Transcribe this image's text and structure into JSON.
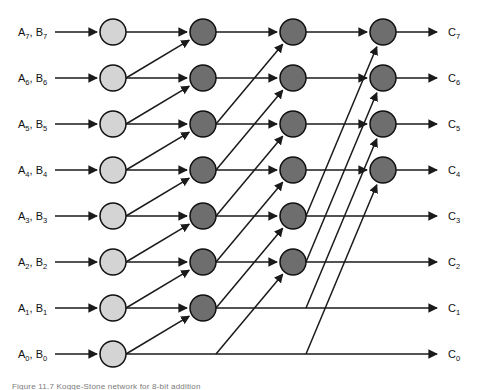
{
  "figure": {
    "caption": "Figure 11.7  Kogge-Stone network for 8-bit addition",
    "width": 483,
    "height": 389,
    "background_color": "#ffffff"
  },
  "colors": {
    "input_node_fill": "#d4d4d4",
    "operator_node_fill": "#6e6e6e",
    "node_stroke": "#111111",
    "edge_stroke": "#1a1a1a",
    "label_text": "#111111",
    "caption_text": "#7a7a7a"
  },
  "geometry": {
    "row_y": [
      32,
      78,
      124,
      170,
      216,
      262,
      308,
      354
    ],
    "column_x": [
      113,
      203,
      293,
      383
    ],
    "node_radius": 13,
    "input_label_x": 18,
    "output_label_x": 448,
    "input_arrow_start_x": 55,
    "output_arrow_end_x": 437
  },
  "rows": [
    {
      "index": 7,
      "y": 32,
      "input_label": "A",
      "input_sub": "7",
      "input_label2": "B",
      "input_sub2": "7",
      "output_label": "C",
      "output_sub": "7",
      "node_columns": [
        0,
        1,
        2,
        3
      ]
    },
    {
      "index": 6,
      "y": 78,
      "input_label": "A",
      "input_sub": "6",
      "input_label2": "B",
      "input_sub2": "6",
      "output_label": "C",
      "output_sub": "6",
      "node_columns": [
        0,
        1,
        2,
        3
      ]
    },
    {
      "index": 5,
      "y": 124,
      "input_label": "A",
      "input_sub": "5",
      "input_label2": "B",
      "input_sub2": "5",
      "output_label": "C",
      "output_sub": "5",
      "node_columns": [
        0,
        1,
        2,
        3
      ]
    },
    {
      "index": 4,
      "y": 170,
      "input_label": "A",
      "input_sub": "4",
      "input_label2": "B",
      "input_sub2": "4",
      "output_label": "C",
      "output_sub": "4",
      "node_columns": [
        0,
        1,
        2,
        3
      ]
    },
    {
      "index": 3,
      "y": 216,
      "input_label": "A",
      "input_sub": "3",
      "input_label2": "B",
      "input_sub2": "3",
      "output_label": "C",
      "output_sub": "3",
      "node_columns": [
        0,
        1,
        2
      ]
    },
    {
      "index": 2,
      "y": 262,
      "input_label": "A",
      "input_sub": "2",
      "input_label2": "B",
      "input_sub2": "2",
      "output_label": "C",
      "output_sub": "2",
      "node_columns": [
        0,
        1,
        2
      ]
    },
    {
      "index": 1,
      "y": 308,
      "input_label": "A",
      "input_sub": "1",
      "input_label2": "B",
      "input_sub2": "1",
      "output_label": "C",
      "output_sub": "1",
      "node_columns": [
        0,
        1
      ]
    },
    {
      "index": 0,
      "y": 354,
      "input_label": "A",
      "input_sub": "0",
      "input_label2": "B",
      "input_sub2": "0",
      "output_label": "C",
      "output_sub": "0",
      "node_columns": [
        0
      ]
    }
  ],
  "chart_data": {
    "type": "diagram",
    "name": "kogge-stone-prefix-network",
    "bit_width": 8,
    "stages": 4,
    "stage_spans": [
      0,
      1,
      2,
      4
    ],
    "input_nodes_count": 8,
    "operator_nodes_count": 17,
    "operator_nodes_per_row": {
      "7": 3,
      "6": 3,
      "5": 3,
      "4": 3,
      "3": 2,
      "2": 2,
      "1": 1,
      "0": 0
    },
    "diagonal_edges": [
      {
        "stage": 2,
        "from_row": 6,
        "to_row": 7
      },
      {
        "stage": 2,
        "from_row": 5,
        "to_row": 6
      },
      {
        "stage": 2,
        "from_row": 4,
        "to_row": 5
      },
      {
        "stage": 2,
        "from_row": 3,
        "to_row": 4
      },
      {
        "stage": 2,
        "from_row": 2,
        "to_row": 3
      },
      {
        "stage": 2,
        "from_row": 1,
        "to_row": 2
      },
      {
        "stage": 2,
        "from_row": 0,
        "to_row": 1
      },
      {
        "stage": 3,
        "from_row": 5,
        "to_row": 7
      },
      {
        "stage": 3,
        "from_row": 4,
        "to_row": 6
      },
      {
        "stage": 3,
        "from_row": 3,
        "to_row": 5
      },
      {
        "stage": 3,
        "from_row": 2,
        "to_row": 4
      },
      {
        "stage": 3,
        "from_row": 1,
        "to_row": 3
      },
      {
        "stage": 3,
        "from_row": 0,
        "to_row": 2
      },
      {
        "stage": 4,
        "from_row": 3,
        "to_row": 7
      },
      {
        "stage": 4,
        "from_row": 2,
        "to_row": 6
      },
      {
        "stage": 4,
        "from_row": 1,
        "to_row": 5
      },
      {
        "stage": 4,
        "from_row": 0,
        "to_row": 4
      }
    ],
    "input_labels": [
      "A7, B7",
      "A6, B6",
      "A5, B5",
      "A4, B4",
      "A3, B3",
      "A2, B2",
      "A1, B1",
      "A0, B0"
    ],
    "output_labels": [
      "C7",
      "C6",
      "C5",
      "C4",
      "C3",
      "C2",
      "C1",
      "C0"
    ]
  }
}
